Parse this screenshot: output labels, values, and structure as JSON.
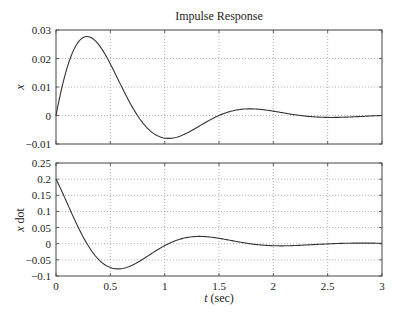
{
  "chart_data": [
    {
      "type": "line",
      "title": "Impulse Response",
      "xlabel": "",
      "ylabel": "x",
      "xlim": [
        0,
        3
      ],
      "ylim": [
        -0.01,
        0.03
      ],
      "grid": true,
      "xticks": [
        "0",
        "0.5",
        "1",
        "1.5",
        "2",
        "2.5",
        "3"
      ],
      "yticks": [
        "-0.01",
        "0",
        "0.01",
        "0.02",
        "0.03"
      ],
      "ytick_values": [
        -0.01,
        0,
        0.01,
        0.02,
        0.03
      ],
      "series": [
        {
          "name": "x",
          "model": {
            "A": 0.0477,
            "sigma": 1.65,
            "omega": 4.19,
            "kind": "x"
          }
        }
      ]
    },
    {
      "type": "line",
      "title": "",
      "xlabel": "t (sec)",
      "ylabel": "x dot",
      "xlim": [
        0,
        3
      ],
      "ylim": [
        -0.1,
        0.25
      ],
      "grid": true,
      "xticks": [
        "0",
        "0.5",
        "1",
        "1.5",
        "2",
        "2.5",
        "3"
      ],
      "yticks": [
        "-0.1",
        "-0.05",
        "0",
        "0.05",
        "0.1",
        "0.15",
        "0.2",
        "0.25"
      ],
      "ytick_values": [
        -0.1,
        -0.05,
        0,
        0.05,
        0.1,
        0.15,
        0.2,
        0.25
      ],
      "series": [
        {
          "name": "x dot",
          "model": {
            "A": 0.0477,
            "sigma": 1.65,
            "omega": 4.19,
            "kind": "xdot"
          }
        }
      ]
    }
  ],
  "labels": {
    "title": "Impulse Response",
    "top_ylabel": "x",
    "bottom_ylabel_italic": "x",
    "bottom_ylabel_rest": " dot",
    "xlabel_italic": "t",
    "xlabel_rest": " (sec)"
  },
  "colors": {
    "line": "#333333",
    "grid": "#9a9a9a",
    "axes": "#444444"
  }
}
